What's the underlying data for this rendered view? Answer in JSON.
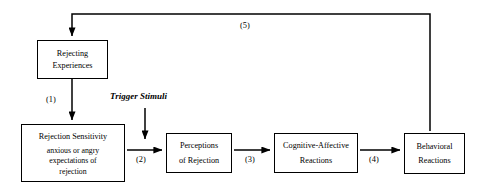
{
  "diagram": {
    "type": "flowchart",
    "nodes": [
      {
        "id": "rejecting-experiences",
        "lines": [
          "Rejecting",
          "Experiences"
        ]
      },
      {
        "id": "rejection-sensitivity",
        "heading": "Rejection Sensitivity",
        "lines": [
          "anxious or angry",
          "expectations of",
          "rejection"
        ]
      },
      {
        "id": "perceptions",
        "lines": [
          "Perceptions",
          "of Rejection"
        ]
      },
      {
        "id": "cognitive-affective",
        "lines": [
          "Cognitive-Affective",
          "Reactions"
        ]
      },
      {
        "id": "behavioral",
        "lines": [
          "Behavioral",
          "Reactions"
        ]
      }
    ],
    "edge_labels": {
      "one": "(1)",
      "two": "(2)",
      "three": "(3)",
      "four": "(4)",
      "five": "(5)"
    },
    "annotations": {
      "trigger_stimuli": "Trigger Stimuli"
    },
    "colors": {
      "stroke": "#000000",
      "background": "#ffffff",
      "text": "#000000"
    }
  }
}
